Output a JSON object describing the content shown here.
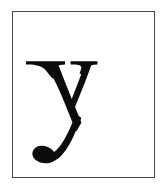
{
  "document": {
    "kind": "letter-specimen",
    "character": "y",
    "character_case": "lowercase",
    "script": "Latin",
    "typeface_style": "Didone serif",
    "caption": "y"
  },
  "canvas": {
    "width_px": 167,
    "height_px": 191,
    "background_color": "#ffffff"
  },
  "frame": {
    "left_px": 12,
    "top_px": 11,
    "width_px": 143,
    "height_px": 167,
    "border_width_px": 1.4,
    "border_color": "#4a4a4a",
    "fill_color": "#ffffff"
  },
  "glyph": {
    "name": "letter-y",
    "color": "#0c0c0c",
    "left_px": 26,
    "top_px": 61,
    "right_px": 96,
    "bottom_px": 159,
    "features": [
      "flat top serifs",
      "high stroke contrast",
      "thick left diagonal",
      "hairline right diagonal",
      "curved descender",
      "ball terminal"
    ]
  }
}
